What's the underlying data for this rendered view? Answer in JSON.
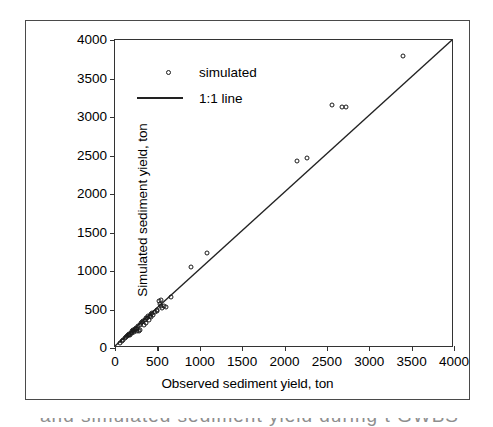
{
  "chart_data": {
    "type": "scatter",
    "title": "",
    "xlabel": "Observed sediment yield, ton",
    "ylabel": "Simulated sediment yield, ton",
    "xlim": [
      0,
      4000
    ],
    "ylim": [
      0,
      4000
    ],
    "xticks": [
      0,
      500,
      1000,
      1500,
      2000,
      2500,
      3000,
      3500,
      4000
    ],
    "yticks": [
      0,
      500,
      1000,
      1500,
      2000,
      2500,
      3000,
      3500,
      4000
    ],
    "grid": false,
    "legend_position": "upper-left",
    "series": [
      {
        "name": "simulated",
        "type": "scatter",
        "marker": "open-circle",
        "color": "#1a1a1a",
        "points": [
          [
            60,
            70
          ],
          [
            85,
            95
          ],
          [
            100,
            110
          ],
          [
            115,
            130
          ],
          [
            125,
            145
          ],
          [
            140,
            150
          ],
          [
            150,
            165
          ],
          [
            160,
            175
          ],
          [
            170,
            185
          ],
          [
            175,
            165
          ],
          [
            185,
            200
          ],
          [
            195,
            215
          ],
          [
            200,
            195
          ],
          [
            210,
            225
          ],
          [
            215,
            240
          ],
          [
            225,
            210
          ],
          [
            235,
            250
          ],
          [
            240,
            230
          ],
          [
            250,
            265
          ],
          [
            255,
            245
          ],
          [
            265,
            215
          ],
          [
            270,
            280
          ],
          [
            280,
            225
          ],
          [
            290,
            300
          ],
          [
            300,
            235
          ],
          [
            310,
            320
          ],
          [
            320,
            340
          ],
          [
            330,
            355
          ],
          [
            340,
            300
          ],
          [
            350,
            370
          ],
          [
            360,
            385
          ],
          [
            370,
            330
          ],
          [
            380,
            395
          ],
          [
            390,
            410
          ],
          [
            400,
            360
          ],
          [
            410,
            420
          ],
          [
            420,
            400
          ],
          [
            430,
            440
          ],
          [
            440,
            455
          ],
          [
            450,
            430
          ],
          [
            470,
            470
          ],
          [
            490,
            500
          ],
          [
            500,
            480
          ],
          [
            520,
            610
          ],
          [
            530,
            575
          ],
          [
            540,
            545
          ],
          [
            545,
            625
          ],
          [
            560,
            520
          ],
          [
            575,
            540
          ],
          [
            600,
            530
          ],
          [
            660,
            665
          ],
          [
            900,
            1050
          ],
          [
            1090,
            1230
          ],
          [
            2150,
            2430
          ],
          [
            2265,
            2470
          ],
          [
            2560,
            3150
          ],
          [
            2680,
            3135
          ],
          [
            2725,
            3130
          ],
          [
            3395,
            3795
          ]
        ]
      },
      {
        "name": "1:1 line",
        "type": "line",
        "color": "#222222",
        "from": [
          0,
          0
        ],
        "to": [
          4000,
          4000
        ]
      }
    ]
  },
  "legend": {
    "items": [
      {
        "label": "simulated",
        "symbol": "open-circle-marker"
      },
      {
        "label": "1:1 line",
        "symbol": "solid-line"
      }
    ]
  },
  "caption_fragment": "and simulated sediment yield during t GWBS"
}
